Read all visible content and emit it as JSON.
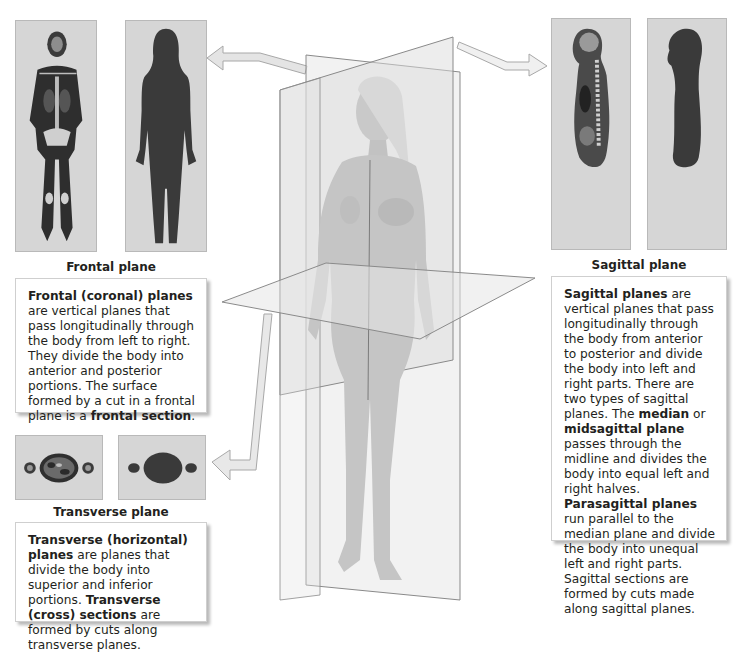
{
  "frontal": {
    "caption": "Frontal plane",
    "description": [
      {
        "text": "Frontal (coronal) planes",
        "bold": true
      },
      {
        "text": " are vertical planes that pass longitudinally through the body from left to right. They divide the body into anterior and posterior portions. The surface formed by a cut in a frontal plane is a ",
        "bold": false
      },
      {
        "text": "frontal section",
        "bold": true
      },
      {
        "text": ".",
        "bold": false
      }
    ],
    "images": [
      "frontal-mri-scan",
      "frontal-silhouette"
    ]
  },
  "transverse": {
    "caption": "Transverse plane",
    "description": [
      {
        "text": "Transverse (horizontal) planes",
        "bold": true
      },
      {
        "text": " are planes that divide the body into superior and inferior portions. ",
        "bold": false
      },
      {
        "text": "Transverse (cross) sections",
        "bold": true
      },
      {
        "text": " are formed by cuts along transverse planes.",
        "bold": false
      }
    ],
    "images": [
      "transverse-mri-scan",
      "transverse-silhouette"
    ]
  },
  "sagittal": {
    "caption": "Sagittal plane",
    "description": [
      {
        "text": "Sagittal planes",
        "bold": true
      },
      {
        "text": " are vertical planes that pass longitudinally through the body from anterior to posterior and divide the body into left and right parts. There are two types of sagittal planes. The ",
        "bold": false
      },
      {
        "text": "median",
        "bold": true
      },
      {
        "text": " or ",
        "bold": false
      },
      {
        "text": "midsagittal plane",
        "bold": true
      },
      {
        "text": " passes through the midline and divides the body into equal left and right halves. ",
        "bold": false
      },
      {
        "text": "Parasagittal planes",
        "bold": true
      },
      {
        "text": " run parallel to the median plane and divide the body into unequal left and right parts. Sagittal sections are formed by cuts made along sagittal planes.",
        "bold": false
      }
    ],
    "images": [
      "sagittal-mri-scan",
      "sagittal-silhouette"
    ]
  },
  "figure": {
    "planes": [
      "frontal",
      "sagittal",
      "transverse"
    ]
  },
  "colors": {
    "panel_bg": "#d6d6d6",
    "silhouette": "#3a3a3a",
    "plane_fill": "#e8e8e8",
    "plane_edge": "#8a8a8a",
    "arrow_fill": "#e4e4e4",
    "arrow_edge": "#a8a8a8",
    "text": "#231f20"
  }
}
